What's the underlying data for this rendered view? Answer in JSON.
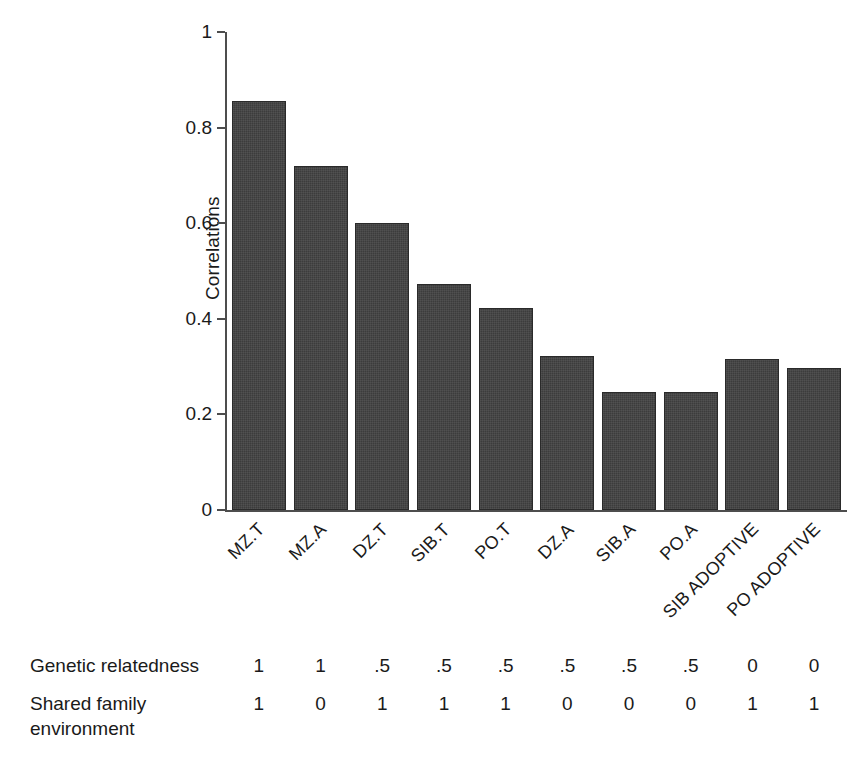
{
  "chart_data": {
    "type": "bar",
    "title": "",
    "xlabel": "",
    "ylabel": "Correlations",
    "ylim": [
      0,
      1
    ],
    "grid": false,
    "legend": "none",
    "categories": [
      "MZ.T",
      "MZ.A",
      "DZ.T",
      "SIB.T",
      "PO.T",
      "DZ.A",
      "SIB.A",
      "PO.A",
      "SIB ADOPTIVE",
      "PO ADOPTIVE"
    ],
    "values": [
      0.855,
      0.72,
      0.6,
      0.472,
      0.422,
      0.323,
      0.247,
      0.247,
      0.315,
      0.298
    ],
    "ytick_labels": [
      "1",
      "0.8",
      "0.6",
      "0.4",
      "0.2",
      "0"
    ],
    "ytick_values": [
      1,
      0.8,
      0.6,
      0.4,
      0.2,
      0
    ],
    "bar_color": "#3c3c3c",
    "axis_color": "#4d4d4d"
  },
  "annotation_table": {
    "rows": [
      {
        "label": "Genetic relatedness",
        "values": [
          "1",
          "1",
          ".5",
          ".5",
          ".5",
          ".5",
          ".5",
          ".5",
          "0",
          "0"
        ]
      },
      {
        "label": "Shared family\nenvironment",
        "values": [
          "1",
          "0",
          "1",
          "1",
          "1",
          "0",
          "0",
          "0",
          "1",
          "1"
        ]
      }
    ]
  }
}
